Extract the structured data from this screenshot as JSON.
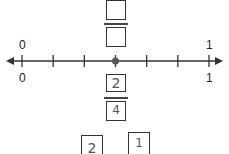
{
  "number_line": {
    "start_label": "0",
    "end_label": "1",
    "divisions": 6,
    "point_position": 3,
    "bottom_start_label": "0",
    "bottom_end_label": "1"
  },
  "top_fraction": {
    "numerator": "",
    "denominator": ""
  },
  "bottom_fraction": {
    "numerator": "2",
    "denominator": "4"
  },
  "extra_boxes": [
    "2",
    "1"
  ]
}
